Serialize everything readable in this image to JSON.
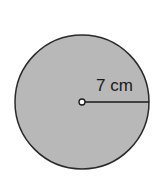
{
  "diagram": {
    "shape": "circle",
    "fill_color": "#b8b8b8",
    "stroke_color": "#2a2a2a",
    "radius_label": "7 cm",
    "radius_value": 7,
    "radius_unit": "cm"
  }
}
